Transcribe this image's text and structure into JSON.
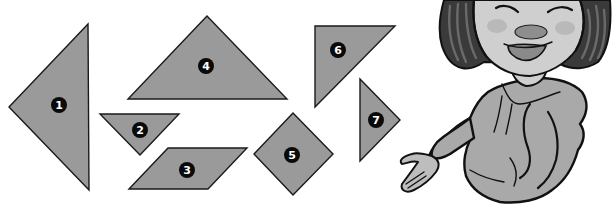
{
  "figure": {
    "colors": {
      "piece_fill": "#9a9a9a",
      "piece_stroke": "#1a1a1a",
      "badge_fill": "#0a0a0a",
      "badge_text": "#ffffff",
      "background": "#ffffff"
    },
    "pieces": [
      {
        "id": "1",
        "label": "1",
        "shape": "large-triangle",
        "points": "88,24 9,107 89,190",
        "label_pos": [
          59,
          105
        ]
      },
      {
        "id": "2",
        "label": "2",
        "shape": "small-triangle",
        "points": "100,114 179,114 140,155",
        "label_pos": [
          140,
          130
        ]
      },
      {
        "id": "3",
        "label": "3",
        "shape": "parallelogram",
        "points": "129,189 168,148 247,148 208,189",
        "label_pos": [
          187,
          170
        ]
      },
      {
        "id": "4",
        "label": "4",
        "shape": "large-triangle",
        "points": "207,16 128,99 287,99",
        "label_pos": [
          206,
          66
        ]
      },
      {
        "id": "5",
        "label": "5",
        "shape": "square",
        "points": "293,113 254,154 293,195 333,154",
        "label_pos": [
          292,
          155
        ]
      },
      {
        "id": "6",
        "label": "6",
        "shape": "medium-triangle",
        "points": "315,26 395,26 315,107",
        "label_pos": [
          338,
          50
        ]
      },
      {
        "id": "7",
        "label": "7",
        "shape": "small-triangle",
        "points": "360,79 400,120 360,161",
        "label_pos": [
          376,
          120
        ]
      }
    ],
    "character": {
      "name": "presenter-girl",
      "pose": "open palm gesturing toward pieces"
    }
  }
}
